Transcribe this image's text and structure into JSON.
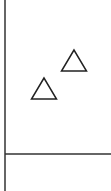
{
  "chart_data": {
    "type": "scatter",
    "title": "",
    "xlabel": "",
    "ylabel": "",
    "grid": false,
    "legend": null,
    "marker": "triangle-open",
    "series": [
      {
        "name": "",
        "marker": "open-triangle",
        "color": "#222222",
        "points": [
          {
            "x": 44,
            "y": 92
          },
          {
            "x": 74,
            "y": 64
          }
        ]
      }
    ],
    "axes": {
      "x_axis_pixel_y": 154,
      "y_axis_pixel_x": 5
    },
    "colors": {
      "axis": "#333333",
      "marker_stroke": "#222222",
      "background": "#ffffff"
    }
  }
}
